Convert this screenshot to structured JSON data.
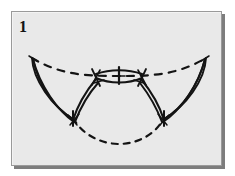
{
  "figure": {
    "panel_label": "1",
    "background_color": "#e9e9e9",
    "page_background_color": "#ffffff",
    "frame_border_color": "#9a9a9a",
    "frame_shadow_color": "#7d7d7d",
    "ink_color": "#141414",
    "elements": [
      {
        "name": "upper-dashed-arc",
        "style": "dashed",
        "label": "upper outline"
      },
      {
        "name": "lower-dashed-arc",
        "style": "dashed",
        "label": "lower outline"
      },
      {
        "name": "left-lobe",
        "style": "solid",
        "label": "left wing lobe"
      },
      {
        "name": "right-lobe",
        "style": "solid",
        "label": "right wing lobe"
      },
      {
        "name": "central-lens",
        "style": "solid",
        "label": "central lens element"
      },
      {
        "name": "center-tick",
        "style": "solid",
        "label": "median tick mark"
      }
    ]
  }
}
